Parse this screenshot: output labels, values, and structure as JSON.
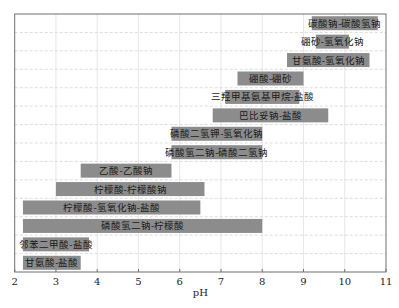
{
  "chart_data": {
    "type": "bar",
    "orientation": "horizontal-range",
    "title": "",
    "xlabel": "pH",
    "ylabel": "",
    "xlim": [
      2,
      11
    ],
    "xticks": [
      2,
      3,
      4,
      5,
      6,
      7,
      8,
      9,
      10,
      11
    ],
    "grid": {
      "vertical": "solid-light",
      "horizontal": "dashed-light"
    },
    "bar_color": "#8c8c8c",
    "series": [
      {
        "name": "碳酸钠-碳酸氢钠",
        "start": 9.2,
        "end": 10.8
      },
      {
        "name": "硼砂-氢氧化钠",
        "start": 9.3,
        "end": 10.1
      },
      {
        "name": "甘氨酸-氢氧化钠",
        "start": 8.6,
        "end": 10.6
      },
      {
        "name": "硼酸-硼砂",
        "start": 7.4,
        "end": 9.0
      },
      {
        "name": "三羟甲基氨基甲烷-盐酸",
        "start": 7.1,
        "end": 8.9
      },
      {
        "name": "巴比妥钠-盐酸",
        "start": 6.8,
        "end": 9.6
      },
      {
        "name": "磷酸二氢钾-氢氧化钠",
        "start": 5.8,
        "end": 8.0
      },
      {
        "name": "磷酸氢二钠-磷酸二氢钠",
        "start": 5.8,
        "end": 8.0
      },
      {
        "name": "乙酸-乙酸钠",
        "start": 3.6,
        "end": 5.8
      },
      {
        "name": "柠檬酸-柠檬酸钠",
        "start": 3.0,
        "end": 6.6
      },
      {
        "name": "柠檬酸-氢氧化钠-盐酸",
        "start": 2.2,
        "end": 6.5
      },
      {
        "name": "磷酸氢二钠-柠檬酸",
        "start": 2.2,
        "end": 8.0
      },
      {
        "name": "邻苯二甲酸-盐酸",
        "start": 2.2,
        "end": 3.8
      },
      {
        "name": "甘氨酸-盐酸",
        "start": 2.2,
        "end": 3.6
      }
    ]
  }
}
